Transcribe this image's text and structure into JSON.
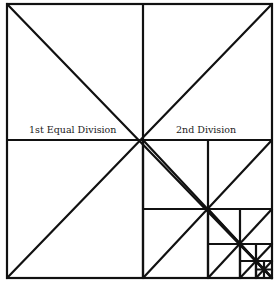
{
  "diagram": {
    "type": "recursive square subdivision",
    "stroke_color": "#111111",
    "background": "#ffffff",
    "labels": {
      "first": "1st Equal Division",
      "second": "2nd Division"
    },
    "levels": [
      {
        "x0": 7,
        "y0": 4,
        "x1": 272,
        "y1": 278
      },
      {
        "x0": 143,
        "y0": 140,
        "x1": 272,
        "y1": 278
      },
      {
        "x0": 208,
        "y0": 209,
        "x1": 272,
        "y1": 278
      },
      {
        "x0": 240,
        "y0": 244,
        "x1": 272,
        "y1": 278
      },
      {
        "x0": 256,
        "y0": 261,
        "x1": 272,
        "y1": 278
      }
    ]
  }
}
